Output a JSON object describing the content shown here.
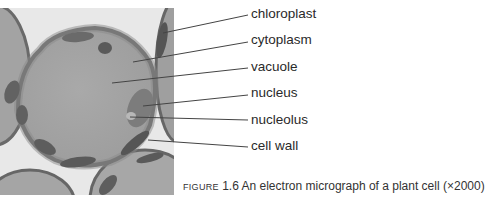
{
  "figure": {
    "labels": [
      {
        "text": "chloroplast",
        "y": 6
      },
      {
        "text": "cytoplasm",
        "y": 32
      },
      {
        "text": "vacuole",
        "y": 59
      },
      {
        "text": "nucleus",
        "y": 85
      },
      {
        "text": "nucleolus",
        "y": 112
      },
      {
        "text": "cell wall",
        "y": 138
      }
    ],
    "caption": {
      "figure_word": "Figure",
      "number": "1.6",
      "text": "An electron micrograph of a plant cell (×2000)"
    }
  },
  "colors": {
    "background": "#ffffff",
    "micrograph_bg": "#e6e6e6",
    "cell_fill": "#a8a8a8",
    "cell_wall": "#6a6a6a",
    "chloroplast": "#555555",
    "leader_line": "#444444",
    "label_text": "#2a2a2a"
  }
}
